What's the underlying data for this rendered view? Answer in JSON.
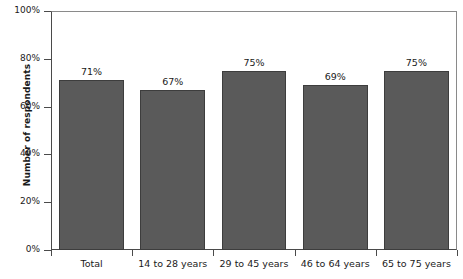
{
  "chart_data": {
    "type": "bar",
    "title": "",
    "subtitle": "",
    "xlabel": "",
    "ylabel": "Number of respondents",
    "ylim": [
      0,
      100
    ],
    "yunit": "%",
    "grid": false,
    "legend": false,
    "legend_position": "none",
    "bar_color": "#5a5a5a",
    "bar_edge_color": "#3d3d3d",
    "axis_color": "#4a4a4a",
    "categories": [
      "Total",
      "14 to 28 years",
      "29 to 45 years",
      "46 to 64 years",
      "65 to 75 years"
    ],
    "values": [
      71,
      67,
      75,
      69,
      75
    ],
    "data_labels": [
      "71%",
      "67%",
      "75%",
      "69%",
      "75%"
    ],
    "yticks": [
      0,
      20,
      40,
      60,
      80,
      100
    ],
    "ytick_labels": [
      "0%",
      "20%",
      "40%",
      "60%",
      "80%",
      "100%"
    ]
  }
}
